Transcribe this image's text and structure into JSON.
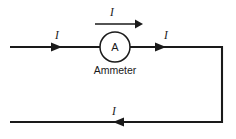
{
  "diagram": {
    "background_color": "#ffffff",
    "line_color": "#1a1a1a",
    "meter": {
      "symbol_letter": "A",
      "caption": "Ammeter",
      "shape": "circle"
    },
    "labels": {
      "top_current": "I",
      "left_current": "I",
      "right_current": "I",
      "bottom_current": "I"
    },
    "arrows": {
      "top_direction": "right",
      "left_direction": "right",
      "right_direction": "right",
      "bottom_direction": "left"
    }
  }
}
